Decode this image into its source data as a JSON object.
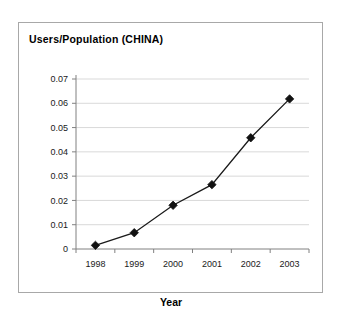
{
  "chart_data": {
    "type": "line",
    "title": "Users/Population (CHINA)",
    "xlabel": "Year",
    "ylabel": "",
    "categories": [
      "1998",
      "1999",
      "2000",
      "2001",
      "2002",
      "2003"
    ],
    "values": [
      0.0015,
      0.0067,
      0.018,
      0.0265,
      0.0458,
      0.0618
    ],
    "series": [
      {
        "name": "Users/Population (CHINA)",
        "values": [
          0.0015,
          0.0067,
          0.018,
          0.0265,
          0.0458,
          0.0618
        ]
      }
    ],
    "ylim": [
      0,
      0.07
    ],
    "ytick_labels": [
      "0",
      "0.01",
      "0.02",
      "0.03",
      "0.04",
      "0.05",
      "0.06",
      "0.07"
    ],
    "ytick_values": [
      0,
      0.01,
      0.02,
      0.03,
      0.04,
      0.05,
      0.06,
      0.07
    ],
    "xtick_labels": [
      "1998",
      "1999",
      "2000",
      "2001",
      "2002",
      "2003"
    ],
    "grid": "horizontal",
    "legend": "none",
    "marker_style": "diamond",
    "line_color": "#1a1a1a",
    "marker_color": "#111111",
    "grid_color": "#d9d9d9",
    "axis_color": "#808080",
    "plot_background": "#ffffff"
  }
}
